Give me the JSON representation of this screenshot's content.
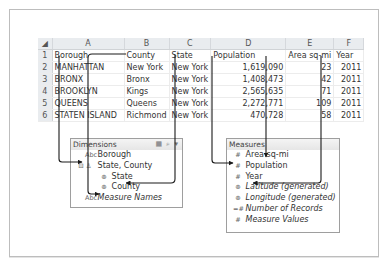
{
  "spreadsheet": {
    "column_letters": [
      "A",
      "B",
      "C",
      "D",
      "E",
      "F"
    ],
    "header_row_number": "1",
    "headers": [
      "Borough",
      "County",
      "State",
      "Population",
      "Area sq-mi",
      "Year"
    ],
    "rows": [
      {
        "n": "2",
        "cells": [
          "MANHATTAN",
          "New York",
          "New York",
          "1,619,090",
          "23",
          "2011"
        ]
      },
      {
        "n": "3",
        "cells": [
          "BRONX",
          "Bronx",
          "New York",
          "1,408,473",
          "42",
          "2011"
        ]
      },
      {
        "n": "4",
        "cells": [
          "BROOKLYN",
          "Kings",
          "New York",
          "2,565,635",
          "71",
          "2011"
        ]
      },
      {
        "n": "5",
        "cells": [
          "QUEENS",
          "Queens",
          "New York",
          "2,272,771",
          "109",
          "2011"
        ]
      },
      {
        "n": "6",
        "cells": [
          "STATEN ISLAND",
          "Richmond",
          "New York",
          "470,728",
          "58",
          "2011"
        ]
      }
    ]
  },
  "dimensions": {
    "title": "Dimensions",
    "header_icons": "▦ ⌕ ▾",
    "items": [
      {
        "icon": "Abc",
        "label": "Borough"
      },
      {
        "icon": "⊟ ♙",
        "label": "State, County"
      },
      {
        "icon": "⊕",
        "label": "State"
      },
      {
        "icon": "⊕",
        "label": "County"
      },
      {
        "icon": "Abc",
        "label": "Measure Names"
      }
    ]
  },
  "measures": {
    "title": "Measures",
    "items": [
      {
        "icon": "#",
        "label": "Area sq-mi"
      },
      {
        "icon": "#",
        "label": "Population"
      },
      {
        "icon": "#",
        "label": "Year"
      },
      {
        "icon": "⊕",
        "label": "Latitude (generated)"
      },
      {
        "icon": "⊕",
        "label": "Longitude (generated)"
      },
      {
        "icon": "=#",
        "label": "Number of Records"
      },
      {
        "icon": "#",
        "label": "Measure Values"
      }
    ]
  },
  "colors": {
    "arrow": "#1a1a1a",
    "header_bg": "#e9ecef",
    "panel_border": "#9e9e9e"
  }
}
